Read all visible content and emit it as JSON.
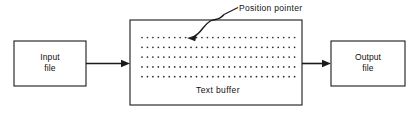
{
  "diagram": {
    "background_color": "#ffffff",
    "line_color": "#1a1a1a",
    "dot_color": "#2b2b2b",
    "nodes": [
      {
        "id": "input-file",
        "label": "Input\nfile",
        "shape": "rectangle",
        "x": 14,
        "y": 41,
        "width": 72,
        "height": 45
      },
      {
        "id": "text-buffer",
        "label": "Text buffer",
        "shape": "rectangle",
        "x": 130,
        "y": 20,
        "width": 172,
        "height": 85
      },
      {
        "id": "output-file",
        "label": "Output\nfile",
        "shape": "rectangle",
        "x": 331,
        "y": 41,
        "width": 74,
        "height": 45
      }
    ],
    "edges": [
      {
        "id": "input-to-buffer",
        "from": "input-file",
        "to": "text-buffer",
        "style": "solid-arrow",
        "direction": "right"
      },
      {
        "id": "buffer-to-output",
        "from": "text-buffer",
        "to": "output-file",
        "style": "solid-arrow",
        "direction": "right"
      }
    ],
    "annotations": [
      {
        "id": "position-pointer",
        "label": "Position pointer",
        "style": "curved-arrow-with-leader",
        "points_to": "text-buffer-first-row"
      }
    ],
    "dot_grid": {
      "rows": 5,
      "columns": 29,
      "start_x": 142,
      "start_y": 37.5,
      "step_x": 5.45,
      "step_y": 9.8,
      "dot_radius": 0.85
    }
  }
}
